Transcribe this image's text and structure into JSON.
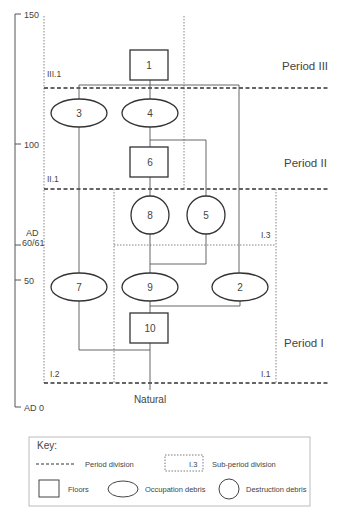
{
  "time_axis": {
    "ticks": [
      {
        "label": "150",
        "y": 14
      },
      {
        "label": "100",
        "y": 144
      },
      {
        "label": "50",
        "y": 280
      },
      {
        "label": "AD 0",
        "y": 407
      }
    ],
    "special_label_line1": "AD",
    "special_label_line2": "60/61"
  },
  "periods": [
    {
      "label": "Period III"
    },
    {
      "label": "Period II"
    },
    {
      "label": "Period I"
    }
  ],
  "sub_periods": [
    {
      "label": "III.1"
    },
    {
      "label": "II.1"
    },
    {
      "label": "I.3"
    },
    {
      "label": "I.2"
    },
    {
      "label": "I.1"
    }
  ],
  "nodes": [
    {
      "id": "1",
      "type": "floor"
    },
    {
      "id": "3",
      "type": "occupation"
    },
    {
      "id": "4",
      "type": "occupation"
    },
    {
      "id": "6",
      "type": "floor"
    },
    {
      "id": "8",
      "type": "destruction"
    },
    {
      "id": "5",
      "type": "destruction"
    },
    {
      "id": "7",
      "type": "occupation"
    },
    {
      "id": "9",
      "type": "occupation"
    },
    {
      "id": "2",
      "type": "occupation"
    },
    {
      "id": "10",
      "type": "floor"
    }
  ],
  "base_label": "Natural",
  "key": {
    "title": "Key:",
    "period_division": "Period division",
    "sub_period_sample": "I.3",
    "sub_period_division": "Sub-period division",
    "floors": "Floors",
    "occupation_debris": "Occupation debris",
    "destruction_debris": "Destruction debris"
  }
}
